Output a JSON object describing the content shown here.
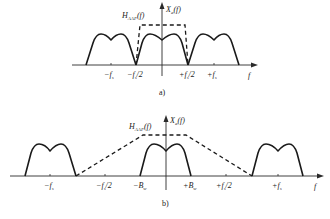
{
  "panels": {
    "a": {
      "caption": "a)",
      "filter_label": "H",
      "filter_sub": "AAF",
      "filter_arg": "(f)",
      "spectrum_label": "X",
      "spectrum_sub": "a",
      "spectrum_arg": "(f)",
      "axis_label": "f",
      "ticks": [
        "−f",
        "−f",
        "+f",
        "+f"
      ],
      "tick_labels": {
        "neg_fs": "−f",
        "neg_fs_sub": "s",
        "neg_half_fs": "−f",
        "neg_half_fs_sub": "s",
        "neg_half_fs_suffix": "/2",
        "pos_half_fs": "+f",
        "pos_half_fs_sub": "s",
        "pos_half_fs_suffix": "/2",
        "pos_fs": "+f",
        "pos_fs_sub": "s"
      }
    },
    "b": {
      "caption": "b)",
      "filter_label": "H",
      "filter_sub": "AAF",
      "filter_arg": "(f)",
      "spectrum_label": "X",
      "spectrum_sub": "a",
      "spectrum_arg": "(f)",
      "axis_label": "f",
      "tick_labels": {
        "neg_fs": "−f",
        "neg_fs_sub": "s",
        "neg_half_fs": "−f",
        "neg_half_fs_sub": "s",
        "neg_half_fs_suffix": "/2",
        "neg_bw": "−B",
        "neg_bw_sub": "w",
        "pos_bw": "+B",
        "pos_bw_sub": "w",
        "pos_half_fs": "+f",
        "pos_half_fs_sub": "s",
        "pos_half_fs_suffix": "/2",
        "pos_fs": "+f",
        "pos_fs_sub": "s"
      }
    }
  }
}
